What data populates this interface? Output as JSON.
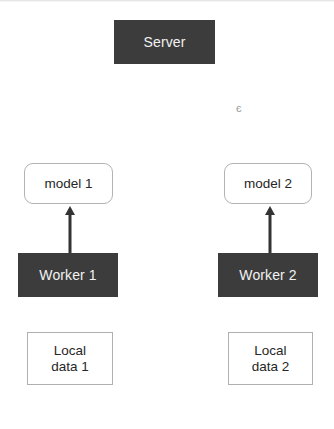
{
  "diagram": {
    "background_color": "#ffffff",
    "dark_fill_color": "#3c3c3c",
    "dark_text_color": "#f2f2f2",
    "light_fill_color": "#ffffff",
    "light_text_color": "#262626",
    "border_color": "#b3b3b3",
    "arrow_color": "#333333"
  },
  "nodes": {
    "server": {
      "label": "Server"
    },
    "model_1": {
      "label": "model 1"
    },
    "model_2": {
      "label": "model 2"
    },
    "worker_1": {
      "label": "Worker 1"
    },
    "worker_2": {
      "label": "Worker 2"
    },
    "local_data_1": {
      "label": "Local\ndata 1"
    },
    "local_data_2": {
      "label": "Local\ndata 2"
    }
  },
  "edges": [
    {
      "name": "worker-1-to-model-1",
      "from": "worker_1",
      "to": "model_1",
      "direction": "up"
    },
    {
      "name": "worker-2-to-model-2",
      "from": "worker_2",
      "to": "model_2",
      "direction": "up"
    }
  ],
  "artifacts": {
    "ink_smudge": {
      "glyph": "є"
    }
  }
}
